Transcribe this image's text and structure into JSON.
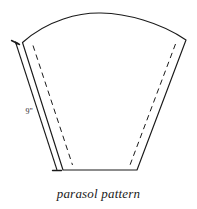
{
  "figure": {
    "caption": "parasol pattern",
    "title": "parasol pattern",
    "dimension_label": "9\"",
    "stroke_color": "#1a1a1a",
    "fill_color": "#ffffff",
    "background_color": "#ffffff",
    "shape_description": "curved trapezoidal gore panel with arced top edge, straight bottom edge and flared sides",
    "elements": {
      "outline_name": "panel-outline",
      "seam_name": "seam-allowance-dashed-line",
      "dimension_name": "side-dimension-line",
      "arrow_name": "dimension-arrow-tick"
    }
  }
}
